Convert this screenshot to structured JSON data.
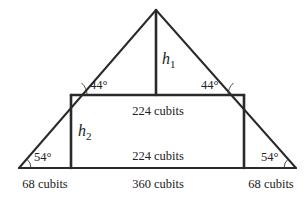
{
  "diagram": {
    "angles": {
      "top_left": "44°",
      "top_right": "44°",
      "bottom_left": "54°",
      "bottom_right": "54°"
    },
    "heights": {
      "h1": {
        "var": "h",
        "sub": "1"
      },
      "h2": {
        "var": "h",
        "sub": "2"
      }
    },
    "lengths": {
      "rect_top": "224 cubits",
      "rect_bottom_inner": "224 cubits",
      "base_left": "68 cubits",
      "base_middle": "360 cubits",
      "base_right": "68 cubits"
    }
  }
}
